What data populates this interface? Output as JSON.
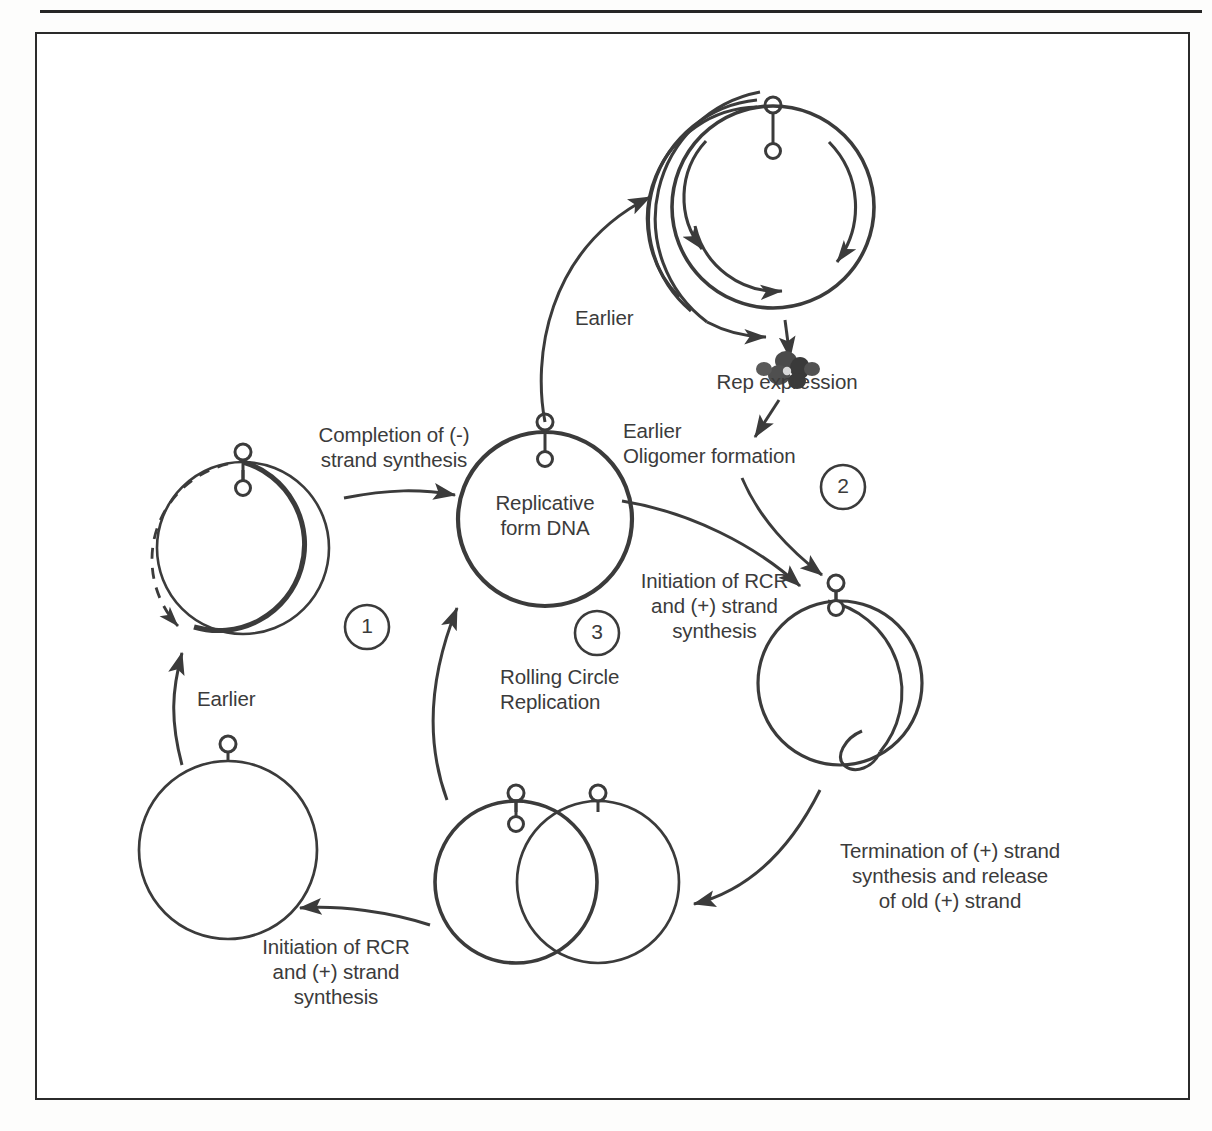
{
  "figure": {
    "type": "cycle-diagram",
    "background_color": "#ffffff",
    "stroke_color": "#3b3b3b",
    "frame": {
      "present": true,
      "border_color": "#2b2b2b"
    },
    "top_rule": {
      "present": true,
      "color": "#262626"
    }
  },
  "labels": {
    "completion_minus_strand": "Completion of (-)\nstrand synthesis",
    "replicative_form": "Replicative\nform DNA",
    "earlier_top": "Earlier",
    "rep_expression": "Rep expression",
    "earlier_oligomer": "Earlier\nOligomer formation",
    "initiation_rcr_right": "Initiation of RCR\nand (+) strand\nsynthesis",
    "rolling_circle_replication": "Rolling Circle\nReplication",
    "earlier_left": "Earlier",
    "initiation_rcr_bottom": "Initiation of RCR\nand (+) strand\nsynthesis",
    "termination": "Termination of (+) strand\nsynthesis and release\nof old (+) strand"
  },
  "step_badges": [
    {
      "id": "badge-1",
      "number": "1"
    },
    {
      "id": "badge-2",
      "number": "2"
    },
    {
      "id": "badge-3",
      "number": "3"
    }
  ],
  "nodes": [
    {
      "id": "ss-circle-bottom-left",
      "name": "single-stranded-circle",
      "style": "thin-circle-with-hairpin"
    },
    {
      "id": "rf-circle-step1",
      "name": "partially-double-stranded-circle",
      "style": "thick-arc-plus-dashed-arc-with-hairpin"
    },
    {
      "id": "rf-dna-circle",
      "name": "replicative-form-dna-circle",
      "style": "bold-circle-with-hairpin"
    },
    {
      "id": "oligomer-circle",
      "name": "oligomer-circle",
      "style": "multi-arc-circle-with-hairpin-and-direction-arrows"
    },
    {
      "id": "rep-protein",
      "name": "rep-protein-multimer",
      "style": "dark-blob-cluster"
    },
    {
      "id": "rolling-circle",
      "name": "rolling-circle-with-displaced-loop",
      "style": "circle-with-displacement-loop-and-hairpin"
    },
    {
      "id": "twin-circles",
      "name": "overlapping-twin-circles",
      "style": "two-overlapping-circles-with-hairpins"
    }
  ],
  "arrows": [
    {
      "id": "arrow-earlier-left",
      "from": "ss-circle-bottom-left",
      "to": "rf-circle-step1",
      "label": "Earlier"
    },
    {
      "id": "arrow-completion",
      "from": "rf-circle-step1",
      "to": "rf-dna-circle",
      "label": "Completion of (-) strand synthesis"
    },
    {
      "id": "arrow-earlier-top",
      "from": "rf-dna-circle",
      "to": "oligomer-circle",
      "label": "Earlier"
    },
    {
      "id": "arrow-rep-expression",
      "from": "oligomer-circle",
      "to": "rep-protein",
      "label": "Rep expression"
    },
    {
      "id": "arrow-oligomer-formation",
      "from": "rep-protein",
      "to": "rolling-circle",
      "label": "Earlier Oligomer formation"
    },
    {
      "id": "arrow-initiation-rcr",
      "from": "rf-dna-circle",
      "to": "rolling-circle",
      "label": "Initiation of RCR and (+) strand synthesis"
    },
    {
      "id": "arrow-termination",
      "from": "rolling-circle",
      "to": "twin-circles",
      "label": "Termination of (+) strand synthesis and release of old (+) strand"
    },
    {
      "id": "arrow-initiation-bottom",
      "from": "twin-circles",
      "to": "ss-circle-bottom-left",
      "label": "Initiation of RCR and (+) strand synthesis"
    },
    {
      "id": "arrow-recycle",
      "from": "twin-circles",
      "to": "rf-dna-circle",
      "label": ""
    }
  ]
}
